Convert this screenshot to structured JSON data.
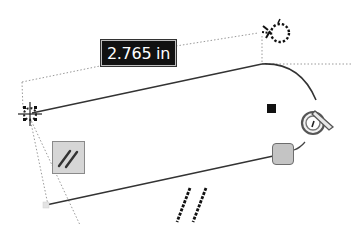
{
  "sketch": {
    "dimension": {
      "value": "2.765 in"
    },
    "constraints": [
      {
        "type": "parallel",
        "icon": "parallel-icon"
      },
      {
        "type": "parallel",
        "icon": "parallel-glyph-icon"
      },
      {
        "type": "tangent",
        "icon": "tangent-icon"
      },
      {
        "type": "coincident",
        "icon": "coincident-icon"
      },
      {
        "type": "fixed",
        "icon": "fix-point-icon"
      }
    ],
    "colors": {
      "geometry": "#333333",
      "construction": "#aaaaaa",
      "label_bg": "#111111",
      "label_text": "#ffffff",
      "handle_fill": "#c4c4c4"
    }
  }
}
